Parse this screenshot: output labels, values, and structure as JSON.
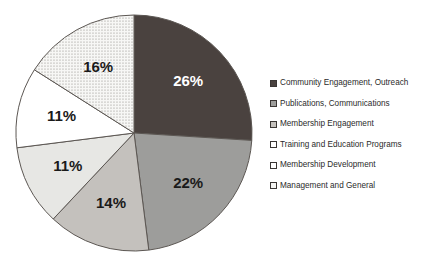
{
  "chart_data": {
    "type": "pie",
    "title": "",
    "subtitle": "",
    "xlabel": "",
    "ylabel": "",
    "grid": false,
    "legend_position": "right",
    "value_unit": "percent",
    "start_angle_deg": 0,
    "direction": "clockwise",
    "categories": [
      "Community Engagement, Outreach",
      "Publications, Communications",
      "Membership Engagement",
      "Training and Education Programs",
      "Membership Development",
      "Management and General"
    ],
    "values": [
      26,
      22,
      14,
      11,
      11,
      16
    ],
    "labels": [
      "26%",
      "22%",
      "14%",
      "11%",
      "11%",
      "16%"
    ],
    "slices": [
      {
        "name": "Community Engagement, Outreach",
        "value": 26,
        "label": "26%",
        "fill": "#4a423f",
        "pattern": "solid",
        "label_color": "#ffffff"
      },
      {
        "name": "Publications, Communications",
        "value": 22,
        "label": "22%",
        "fill": "#9d9d9b",
        "pattern": "solid",
        "label_color": "#1a1a1a"
      },
      {
        "name": "Membership Engagement",
        "value": 14,
        "label": "14%",
        "fill": "#c4c1bd",
        "pattern": "solid",
        "label_color": "#1a1a1a"
      },
      {
        "name": "Training and Education Programs",
        "value": 11,
        "label": "11%",
        "fill": "#e7e7e4",
        "pattern": "solid",
        "label_color": "#1a1a1a"
      },
      {
        "name": "Membership Development",
        "value": 11,
        "label": "11%",
        "fill": "#ffffff",
        "pattern": "solid",
        "label_color": "#1a1a1a"
      },
      {
        "name": "Management and General",
        "value": 16,
        "label": "16%",
        "fill": "#f4f4f2",
        "pattern": "dotted",
        "label_color": "#1a1a1a"
      }
    ]
  },
  "legend": {
    "items": [
      {
        "label": "Community Engagement, Outreach",
        "swatch": "#4a423f",
        "pattern": "solid"
      },
      {
        "label": "Publications, Communications",
        "swatch": "#9d9d9b",
        "pattern": "solid"
      },
      {
        "label": "Membership Engagement",
        "swatch": "#c4c1bd",
        "pattern": "solid"
      },
      {
        "label": "Training and Education Programs",
        "swatch": "#ffffff",
        "pattern": "solid"
      },
      {
        "label": "Membership Development",
        "swatch": "#ffffff",
        "pattern": "solid"
      },
      {
        "label": "Management and General",
        "swatch": "#f4f4f2",
        "pattern": "dotted"
      }
    ]
  },
  "colors": {
    "background": "#ffffff",
    "slice_outline": "#5c5753",
    "legend_swatch_border": "#3a3634",
    "text": "#2b2b2b"
  }
}
